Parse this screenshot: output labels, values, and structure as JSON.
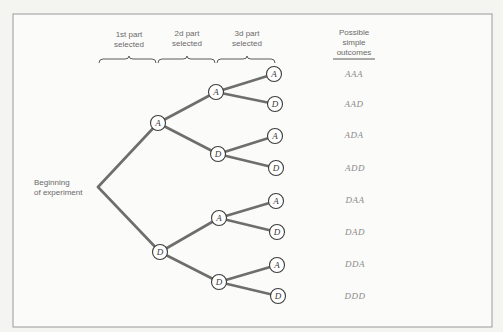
{
  "diagram": {
    "type": "probability-tree",
    "headers": [
      {
        "line1": "1st part",
        "line2": "selected"
      },
      {
        "line1": "2d part",
        "line2": "selected"
      },
      {
        "line1": "3d part",
        "line2": "selected"
      }
    ],
    "outcomes_header": {
      "line1": "Possible",
      "line2": "simple",
      "line3": "outcomes"
    },
    "root_label": {
      "line1": "Beginning",
      "line2": "of experiment"
    },
    "level1": [
      "A",
      "D"
    ],
    "level2": [
      "A",
      "D",
      "A",
      "D"
    ],
    "level3": [
      "A",
      "D",
      "A",
      "D",
      "A",
      "D",
      "A",
      "D"
    ],
    "outcomes": [
      "AAA",
      "AAD",
      "ADA",
      "ADD",
      "DAA",
      "DAD",
      "DDA",
      "DDD"
    ],
    "colors": {
      "edge": "#6e6e6e",
      "node_stroke": "#3c3c3c",
      "text": "#6a6a6a",
      "outcome_text": "#8a8a8a"
    }
  }
}
